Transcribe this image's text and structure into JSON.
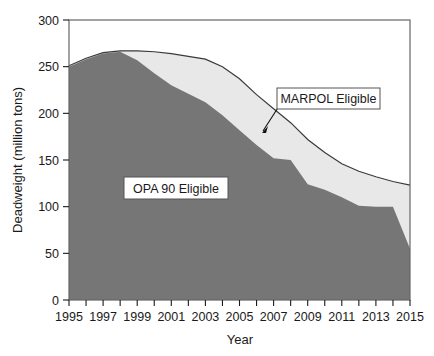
{
  "chart_data": {
    "type": "area",
    "title": "",
    "xlabel": "Year",
    "ylabel": "Deadweight (million tons)",
    "xlim": [
      1995,
      2015
    ],
    "ylim": [
      0,
      300
    ],
    "ytick_values": [
      0,
      50,
      100,
      150,
      200,
      250,
      300
    ],
    "ytick_labels": [
      "0",
      "50",
      "100",
      "150",
      "200",
      "250",
      "300"
    ],
    "xtick_values": [
      1995,
      1996,
      1997,
      1998,
      1999,
      2000,
      2001,
      2002,
      2003,
      2004,
      2005,
      2006,
      2007,
      2008,
      2009,
      2010,
      2011,
      2012,
      2013,
      2014,
      2015
    ],
    "xtick_labels": [
      "1995",
      "",
      "1997",
      "",
      "1999",
      "",
      "2001",
      "",
      "2003",
      "",
      "2005",
      "",
      "2007",
      "",
      "2009",
      "",
      "2011",
      "",
      "2013",
      "",
      "2015"
    ],
    "grid": false,
    "legend_position": "inline-callouts",
    "stacked": true,
    "x": [
      1995,
      1996,
      1997,
      1998,
      1999,
      2000,
      2001,
      2002,
      2003,
      2004,
      2005,
      2006,
      2007,
      2008,
      2009,
      2010,
      2011,
      2012,
      2013,
      2014,
      2015
    ],
    "series": [
      {
        "name": "OPA 90 Eligible",
        "color": "#767676",
        "values": [
          250,
          258,
          264,
          266,
          257,
          243,
          230,
          221,
          212,
          198,
          182,
          166,
          152,
          150,
          124,
          118,
          110,
          101,
          100,
          100,
          55
        ]
      },
      {
        "name": "MARPOL Eligible",
        "color": "#e8e8e8",
        "note": "Upper boundary is the total (OPA 90 + MARPOL-only) deadweight",
        "total_values": [
          251,
          259,
          265,
          267,
          267,
          266,
          264,
          261,
          258,
          250,
          237,
          220,
          205,
          190,
          172,
          158,
          146,
          138,
          132,
          127,
          123
        ]
      }
    ],
    "annotations": [
      {
        "name": "marpol-callout",
        "label": "MARPOL Eligible",
        "points_to_year": 2006
      },
      {
        "name": "opa90-callout",
        "label": "OPA 90 Eligible"
      }
    ]
  },
  "axes": {
    "y_title": "Deadweight (million tons)",
    "x_title": "Year"
  },
  "callouts": {
    "marpol": "MARPOL Eligible",
    "opa90": "OPA 90 Eligible"
  }
}
